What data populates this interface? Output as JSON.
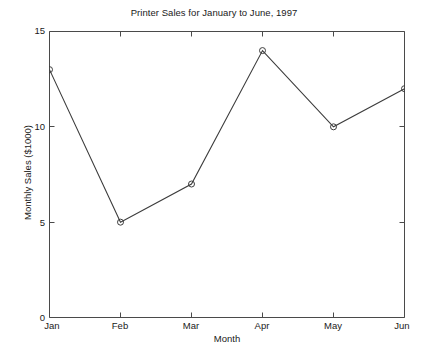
{
  "chart_data": {
    "type": "line",
    "title": "Printer Sales for January to June, 1997",
    "xlabel": "Month",
    "ylabel": "Monthly Sales ($1000)",
    "categories": [
      "Jan",
      "Feb",
      "Mar",
      "Apr",
      "May",
      "Jun"
    ],
    "values": [
      13,
      5,
      7,
      14,
      10,
      12
    ],
    "series": [
      {
        "name": "Monthly Sales",
        "values": [
          13,
          5,
          7,
          14,
          10,
          12
        ]
      }
    ],
    "ylim": [
      0,
      15
    ],
    "yticks": [
      0,
      5,
      10,
      15
    ],
    "ytick_labels": [
      "0",
      "5",
      "10",
      "15"
    ],
    "xtick_labels": [
      "Jan",
      "Feb",
      "Mar",
      "Apr",
      "May",
      "Jun"
    ],
    "grid": false,
    "legend": false,
    "marker": "open-circle",
    "line_color": "#3c3c3c",
    "marker_color": "#3c3c3c",
    "axis_color": "#4a4a4a",
    "background_color": "#ffffff"
  }
}
